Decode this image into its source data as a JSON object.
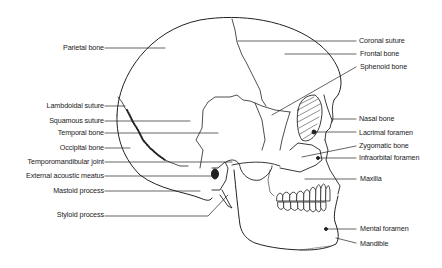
{
  "diagram": {
    "left_labels": [
      {
        "text": "Parietal bone",
        "y": 48
      },
      {
        "text": "Lambdoidal suture",
        "y": 106
      },
      {
        "text": "Squamous suture",
        "y": 121
      },
      {
        "text": "Temporal bone",
        "y": 133
      },
      {
        "text": "Occipital bone",
        "y": 148
      },
      {
        "text": "Temporomandibular joint",
        "y": 162
      },
      {
        "text": "External acoustic meatus",
        "y": 176
      },
      {
        "text": "Mastoid process",
        "y": 191
      },
      {
        "text": "Styloid process",
        "y": 215
      }
    ],
    "right_labels": [
      {
        "text": "Coronal suture",
        "y": 41
      },
      {
        "text": "Frontal bone",
        "y": 54
      },
      {
        "text": "Sphenoid bone",
        "y": 67
      },
      {
        "text": "Nasal bone",
        "y": 119
      },
      {
        "text": "Lacrimal foramen",
        "y": 133
      },
      {
        "text": "Zygomatic bone",
        "y": 146
      },
      {
        "text": "Infraorbital foramen",
        "y": 158
      },
      {
        "text": "Maxilla",
        "y": 179
      },
      {
        "text": "Mental foramen",
        "y": 229
      },
      {
        "text": "Mandible",
        "y": 244
      }
    ]
  }
}
